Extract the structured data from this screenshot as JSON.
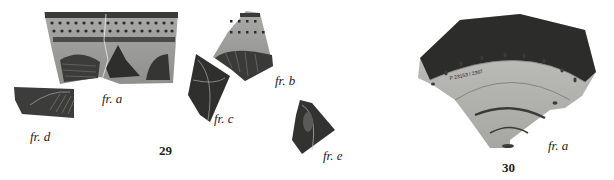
{
  "figure": {
    "groups": [
      {
        "number": "29",
        "fragments": [
          {
            "label": "fr. a"
          },
          {
            "label": "fr. b"
          },
          {
            "label": "fr. c"
          },
          {
            "label": "fr. d"
          },
          {
            "label": "fr. e"
          }
        ]
      },
      {
        "number": "30",
        "fragments": [
          {
            "label": "fr. a"
          }
        ]
      }
    ],
    "inscription_30": "P 23153 / 2367"
  }
}
